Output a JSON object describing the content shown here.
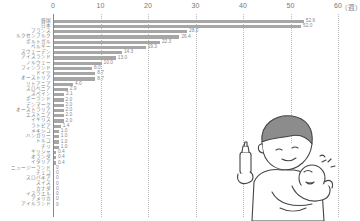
{
  "chart_data": {
    "type": "bar",
    "orientation": "horizontal",
    "title": "",
    "xlabel": "",
    "ylabel": "",
    "unit": "（週）",
    "xlim": [
      0,
      60
    ],
    "xticks": [
      0,
      10,
      20,
      30,
      40,
      50,
      60
    ],
    "grid": true,
    "legend": "none",
    "categories": [
      "韓国",
      "日本",
      "フランス",
      "ルクセンブルク",
      "ポルトガル",
      "ベルギー",
      "スウェーデン",
      "アイスランド",
      "ノルウェー",
      "フィンランド",
      "ドイツ",
      "オーストリア",
      "リトアニア",
      "スロベニア",
      "スペイン",
      "ポーランド",
      "デンマーク",
      "オーストラリア",
      "エストニア",
      "イギリス",
      "ラトビア",
      "メキシコ",
      "ハンガリー",
      "トルコ",
      "チリ",
      "ギリシャ",
      "オランダ",
      "イタリア",
      "ニュージーランド",
      "チェコ",
      "スロバキア",
      "スイス",
      "カナダ",
      "イスラエル",
      "アメリカ",
      "アイルランド"
    ],
    "values": [
      52.6,
      52.0,
      28.0,
      26.4,
      22.3,
      19.3,
      14.3,
      13.0,
      10.0,
      8.0,
      8.7,
      8.7,
      4.0,
      2.9,
      2.1,
      2.0,
      2.0,
      2.0,
      2.0,
      2.0,
      1.4,
      1.0,
      1.0,
      1.0,
      1.0,
      0.4,
      0.4,
      0.4,
      0,
      0,
      0,
      0,
      0,
      0,
      0,
      0
    ],
    "value_labels": [
      "52.6",
      "52.0",
      "28.0",
      "26.4",
      "22.3",
      "19.3",
      "14.3",
      "13.0",
      "10.0",
      "8.0",
      "8.7",
      "8.7",
      "4.0",
      "2.9",
      "2.1",
      "2.0",
      "2.0",
      "2.0",
      "2.0",
      "2.0",
      "1.4",
      "1.0",
      "1.0",
      "1.0",
      "1.0",
      "0.4",
      "0.4",
      "0.4",
      "0",
      "0",
      "0",
      "0",
      "0",
      "0",
      "0",
      "0"
    ]
  },
  "colors": {
    "bar": "#a6a6a6",
    "grid": "#bbbbbb",
    "text": "#777777"
  },
  "illustration": {
    "description": "father-bottle-feeding-crying-baby"
  }
}
